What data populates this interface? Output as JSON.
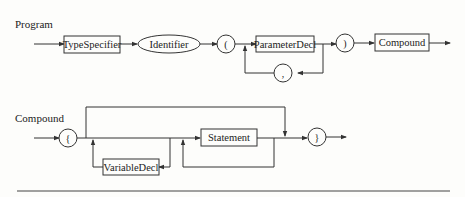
{
  "diagrams": [
    {
      "title": "Program",
      "nodes": {
        "type_specifier": "TypeSpecifier",
        "identifier": "Identifier",
        "lparen": "(",
        "parameter_decl": "ParameterDecl",
        "comma": ",",
        "rparen": ")",
        "compound": "Compound"
      }
    },
    {
      "title": "Compound",
      "nodes": {
        "lbrace": "{",
        "variable_decl": "VariableDecl",
        "statement": "Statement",
        "rbrace": "}"
      }
    }
  ],
  "colors": {
    "stroke": "#333333",
    "background": "#fdfdfb",
    "text": "#222222"
  }
}
